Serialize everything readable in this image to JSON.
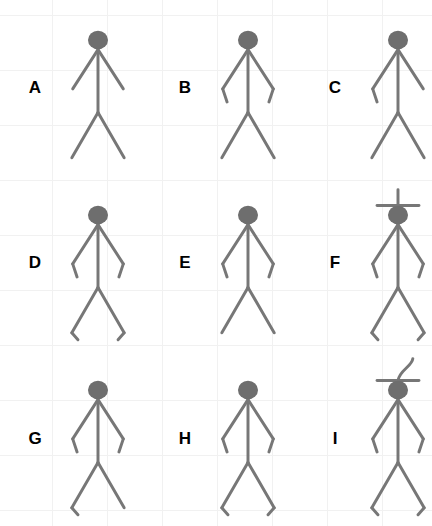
{
  "canvas": {
    "width": 432,
    "height": 526,
    "background_color": "#ffffff",
    "grid_line_color": "#f1f1f1",
    "grid_spacing_px": 55
  },
  "style": {
    "stroke_color": "#777777",
    "head_fill_color": "#6e6e6e",
    "label_color": "#000000",
    "stroke_width": 3.4
  },
  "figures": [
    {
      "label": "A",
      "arms": "straight-both",
      "legs": "straight-both",
      "headwear": "none",
      "description": "stick figure with straight outstretched arms and straight legs"
    },
    {
      "label": "B",
      "arms": "bent-both",
      "legs": "straight-both",
      "headwear": "none",
      "description": "stick figure with both forearms bent downward and straight legs"
    },
    {
      "label": "C",
      "arms": "bent-left",
      "legs": "straight-both",
      "headwear": "none",
      "description": "stick figure with only the left forearm bent and straight legs"
    },
    {
      "label": "D",
      "arms": "bent-both",
      "legs": "bent-both",
      "headwear": "none",
      "description": "stick figure with both forearms bent and both feet bent"
    },
    {
      "label": "E",
      "arms": "bent-both",
      "legs": "straight-both",
      "headwear": "none",
      "description": "stick figure with both forearms bent and straight legs"
    },
    {
      "label": "F",
      "arms": "bent-both",
      "legs": "bent-both",
      "headwear": "bar-with-straight-antenna",
      "description": "stick figure wearing a flat hat bar with a straight vertical antenna, bent arms and bent feet"
    },
    {
      "label": "G",
      "arms": "bent-both",
      "legs": "bent-left",
      "headwear": "none",
      "description": "stick figure with both forearms bent and only the left foot bent"
    },
    {
      "label": "H",
      "arms": "bent-both",
      "legs": "bent-both",
      "headwear": "none",
      "description": "stick figure with both forearms bent and both feet bent"
    },
    {
      "label": "I",
      "arms": "bent-both",
      "legs": "bent-both",
      "headwear": "bar-with-curved-antenna",
      "description": "stick figure wearing a flat hat bar with a curved hooked antenna, bent arms and bent feet"
    }
  ]
}
